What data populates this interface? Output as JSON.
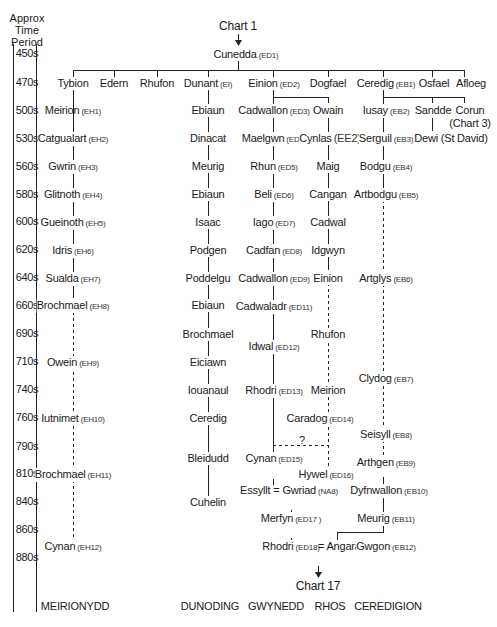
{
  "axis": {
    "heading": [
      "Approx",
      "Time",
      "Period"
    ],
    "periods": [
      "450s",
      "470s",
      "500s",
      "530s",
      "560s",
      "580s",
      "600s",
      "620s",
      "640s",
      "660s",
      "690s",
      "710s",
      "740s",
      "760s",
      "790s",
      "810s",
      "840s",
      "860s",
      "880s"
    ]
  },
  "top_ref": "Chart 1",
  "bottom_ref": "Chart 17",
  "uncertain_mark": "?",
  "people": {
    "cunedda": {
      "name": "Cunedda",
      "code": "(ED1)"
    },
    "tybion": {
      "name": "Tybion",
      "code": ""
    },
    "edern": {
      "name": "Edern",
      "code": ""
    },
    "rhufon": {
      "name": "Rhufon",
      "code": ""
    },
    "dunant": {
      "name": "Dunant",
      "code": "(EI)"
    },
    "einion": {
      "name": "Einion",
      "code": "(ED2)"
    },
    "dogfael": {
      "name": "Dogfael",
      "code": ""
    },
    "ceredig": {
      "name": "Ceredig",
      "code": "(EB1)"
    },
    "osfael": {
      "name": "Osfael",
      "code": ""
    },
    "afloeg": {
      "name": "Afloeg",
      "code": ""
    },
    "meirion1": {
      "name": "Meirion",
      "code": "(EH1)"
    },
    "catgualart": {
      "name": "Catgualart",
      "code": "(EH2)"
    },
    "gwrin": {
      "name": "Gwrin",
      "code": "(EH3)"
    },
    "glitnoth": {
      "name": "Glitnoth",
      "code": "(EH4)"
    },
    "gueinoth": {
      "name": "Gueinoth",
      "code": "(EH5)"
    },
    "idris": {
      "name": "Idris",
      "code": "(EH6)"
    },
    "sualda": {
      "name": "Sualda",
      "code": "(EH7)"
    },
    "brochmael1": {
      "name": "Brochmael",
      "code": "(EH8)"
    },
    "owein": {
      "name": "Owein",
      "code": "(EH9)"
    },
    "iutnimet": {
      "name": "Iutnimet",
      "code": "(EH10)"
    },
    "brochmael2": {
      "name": "Brochmael",
      "code": "(EH11)"
    },
    "cynan1": {
      "name": "Cynan",
      "code": "(EH12)"
    },
    "ebiaun1": {
      "name": "Ebiaun",
      "code": ""
    },
    "dinacat": {
      "name": "Dinacat",
      "code": ""
    },
    "meurig1": {
      "name": "Meurig",
      "code": ""
    },
    "ebiaun2": {
      "name": "Ebiaun",
      "code": ""
    },
    "isaac": {
      "name": "Isaac",
      "code": ""
    },
    "podgen": {
      "name": "Podgen",
      "code": ""
    },
    "poddelgu": {
      "name": "Poddelgu",
      "code": ""
    },
    "ebiaun3": {
      "name": "Ebiaun",
      "code": ""
    },
    "brochmael3": {
      "name": "Brochmael",
      "code": ""
    },
    "eiciawn": {
      "name": "Eiciawn",
      "code": ""
    },
    "iouanaul": {
      "name": "Iouanaul",
      "code": ""
    },
    "ceredig2": {
      "name": "Ceredig",
      "code": ""
    },
    "bleidudd": {
      "name": "Bleidudd",
      "code": ""
    },
    "cuhelin": {
      "name": "Cuhelin",
      "code": ""
    },
    "cadwallon1": {
      "name": "Cadwallon",
      "code": "(ED3)"
    },
    "maelgwn": {
      "name": "Maelgwn",
      "code": "(ED4)"
    },
    "rhun": {
      "name": "Rhun",
      "code": "(ED5)"
    },
    "beli": {
      "name": "Beli",
      "code": "(ED6)"
    },
    "iago": {
      "name": "Iago",
      "code": "(ED7)"
    },
    "cadfan": {
      "name": "Cadfan",
      "code": "(ED8)"
    },
    "cadwallon2": {
      "name": "Cadwallon",
      "code": "(ED9)"
    },
    "cadwaladr": {
      "name": "Cadwaladr",
      "code": "(ED11)"
    },
    "idwal": {
      "name": "Idwal",
      "code": "(ED12)"
    },
    "rhodri1": {
      "name": "Rhodri",
      "code": "(ED13)"
    },
    "cynan2": {
      "name": "Cynan",
      "code": "(ED15)"
    },
    "essyllt": {
      "name": "Essyllt = Gwriad",
      "code": "(NA8)"
    },
    "merfyn": {
      "name": "Merfyn",
      "code": "(ED17 )"
    },
    "rhodri2": {
      "name": "Rhodri",
      "code": "(ED18)"
    },
    "angarad": {
      "name": "= Angarad",
      "code": ""
    },
    "owain": {
      "name": "Owain",
      "code": ""
    },
    "cynlas": {
      "name": "Cynlas",
      "code": "(EE2)"
    },
    "maig": {
      "name": "Maig",
      "code": ""
    },
    "cangan": {
      "name": "Cangan",
      "code": ""
    },
    "cadwal": {
      "name": "Cadwal",
      "code": ""
    },
    "idgwyn": {
      "name": "Idgwyn",
      "code": ""
    },
    "einion2": {
      "name": "Einion",
      "code": ""
    },
    "rhufon2": {
      "name": "Rhufon",
      "code": ""
    },
    "meirion2": {
      "name": "Meirion",
      "code": ""
    },
    "caradog": {
      "name": "Caradog",
      "code": "(ED14)"
    },
    "hywel": {
      "name": "Hywel",
      "code": "(ED16)"
    },
    "iusay": {
      "name": "Iusay",
      "code": "(EB2)"
    },
    "sandde": {
      "name": "Sandde",
      "code": ""
    },
    "corun": {
      "name": "Corun",
      "code": ""
    },
    "corun_ref": {
      "name": "(Chart 3)",
      "code": ""
    },
    "dewi": {
      "name": "Dewi (St David)",
      "code": ""
    },
    "serguil": {
      "name": "Serguil",
      "code": "(EB3)"
    },
    "bodgu": {
      "name": "Bodgu",
      "code": "(EB4)"
    },
    "artbodgu": {
      "name": "Artbodgu",
      "code": "(EB5)"
    },
    "artglys": {
      "name": "Artglys",
      "code": "(EB6)"
    },
    "clydog": {
      "name": "Clydog",
      "code": "(EB7)"
    },
    "seisyll": {
      "name": "Seisyll",
      "code": "(EB8)"
    },
    "arthgen": {
      "name": "Arthgen",
      "code": "(EB9)"
    },
    "dyfnwallon": {
      "name": "Dyfnwallon",
      "code": "(EB10)"
    },
    "meurig2": {
      "name": "Meurig",
      "code": "(EB11)"
    },
    "gwgon": {
      "name": "Gwgon",
      "code": "(EB12)"
    }
  },
  "regions": [
    "MEIRIONYDD",
    "DUNODING",
    "GWYNEDD",
    "RHOS",
    "CEREDIGION"
  ]
}
